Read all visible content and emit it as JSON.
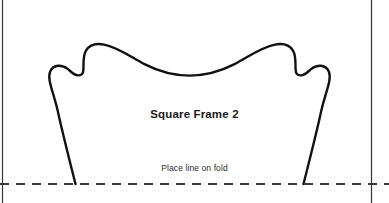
{
  "canvas": {
    "width": 389,
    "height": 203,
    "background": "#ffffff"
  },
  "labels": {
    "title": "Square Frame 2",
    "fold_instruction": "Place line on fold"
  },
  "colors": {
    "outline": "#111111",
    "guide_line": "#333333",
    "fold_line": "#3a3a3a",
    "background": "#ffffff",
    "title_text": "#1a1a1a",
    "instruction_text": "#2b2b2b"
  },
  "geometry": {
    "left_guide_x": 2.5,
    "right_guide_x": 371.5,
    "fold_line_y": 184,
    "outline_stroke_width": 2.4,
    "guide_stroke_width": 1.2,
    "fold_dash_pattern": "9 7",
    "shape_path": "M 75.5 184 C 69.5 160 62.5 133 58.0 112 C 53.5 92 46.8 79.5 50.2 71.5 C 53.5 63.8 62.5 64.6 68.0 69.2 C 71.6 72.2 74.0 75.2 78.0 75.4 C 81.8 75.6 83.2 73.6 83.4 69.6 C 83.7 63.0 82.8 55.8 86.0 50.6 C 89.6 44.8 97.0 43.3 104.0 44.6 C 118.0 47.2 131.0 57.2 145.0 64.4 C 161.0 72.6 176.0 75.6 189.5 75.6 C 203.0 75.6 218.0 72.6 234.0 64.4 C 248.0 57.2 261.0 47.2 275.0 44.6 C 282.0 43.3 289.4 44.8 293.0 50.6 C 296.2 55.8 295.3 63.0 295.6 69.6 C 295.8 73.6 297.2 75.6 301.0 75.4 C 305.0 75.2 307.4 72.2 311.0 69.2 C 316.5 64.6 325.5 63.8 328.8 71.5 C 332.2 79.5 325.5 92 321.0 112 C 316.5 133 309.5 160 303.5 184",
    "left_leg_base_x": 75.5,
    "right_leg_base_x": 303.5,
    "peak_left_x": 104,
    "peak_left_y": 44.6,
    "peak_right_x": 275,
    "peak_right_y": 44.6,
    "center_dip_x": 189.5,
    "center_dip_y": 75.6
  },
  "icons": {
    "fold_line_name": "fold-line-dashed",
    "shape_name": "pattern-outline-shape"
  }
}
